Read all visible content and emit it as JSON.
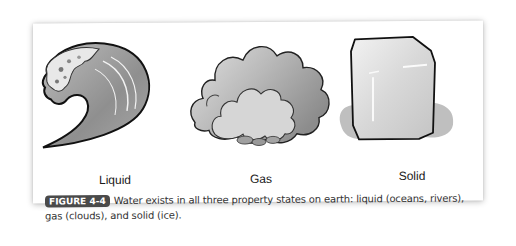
{
  "figure": {
    "illustrations": [
      {
        "id": "liquid",
        "icon": "wave-icon",
        "label": "Liquid"
      },
      {
        "id": "gas",
        "icon": "cloud-icon",
        "label": "Gas"
      },
      {
        "id": "solid",
        "icon": "ice-cube-icon",
        "label": "Solid"
      }
    ],
    "caption": {
      "badge": "FIGURE 4-4",
      "text": "Water exists in all three property states on earth: liquid (oceans, rivers), gas (clouds), and solid (ice)."
    },
    "colors": {
      "badge_bg": "#4a4a4a",
      "badge_text": "#ffffff",
      "page_bg": "#ffffff",
      "illustration_gray": "#9a9a9a"
    }
  }
}
